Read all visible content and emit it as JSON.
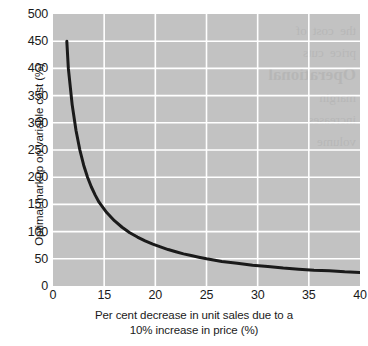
{
  "chart_data": {
    "type": "line",
    "title": "",
    "subtitle": "",
    "xlabel": "Per cent decrease in unit sales due to a 10% increase in price (%)",
    "xlabel_line1": "Per cent decrease in unit sales due to a",
    "xlabel_line2": "10% increase in price (%)",
    "ylabel": "Optimal markup on variable cost (%)",
    "xlim": [
      0,
      40
    ],
    "ylim": [
      0,
      500
    ],
    "xticks": [
      0,
      15,
      20,
      25,
      30,
      35,
      40
    ],
    "xtick_labels": [
      "0",
      "15",
      "20",
      "25",
      "30",
      "35",
      "40"
    ],
    "yticks": [
      0,
      50,
      100,
      150,
      200,
      250,
      300,
      350,
      400,
      450,
      500
    ],
    "ytick_labels": [
      "0",
      "50",
      "100",
      "150",
      "200",
      "250",
      "300",
      "350",
      "400",
      "450",
      "500"
    ],
    "grid": true,
    "grid_color": "#ffffff",
    "plot_background": "#c2c2c2",
    "legend": null,
    "legend_position": "none",
    "series": [
      {
        "name": "Optimal markup",
        "color": "#1a1a1a",
        "line_width": 3,
        "x": [
          1.8,
          2.0,
          2.5,
          3.0,
          3.5,
          4.0,
          4.5,
          5.0,
          5.5,
          6.0,
          7.0,
          8.0,
          9.0,
          10.0,
          11.0,
          12.0,
          13.0,
          14.0,
          15.0,
          16.0,
          17.0,
          18.0,
          19.0,
          20.0,
          22.0,
          24.0,
          25.0,
          26.0,
          28.0,
          30.0,
          32.0,
          34.0,
          36.0,
          38.0,
          40.0
        ],
        "y": [
          450,
          400,
          333,
          286,
          250,
          222,
          200,
          182,
          167,
          154,
          135,
          120,
          108,
          98,
          90,
          83,
          77,
          72,
          67,
          63,
          59,
          56,
          53,
          50,
          45,
          42,
          40,
          38,
          36,
          33,
          31,
          29,
          28,
          26,
          25
        ]
      }
    ],
    "annotations": []
  },
  "page_showthrough": {
    "line1": "the cost of",
    "line2": "price cuts",
    "line3": "margin",
    "line4": "Operational",
    "line5": "increases",
    "line6": "volume"
  }
}
